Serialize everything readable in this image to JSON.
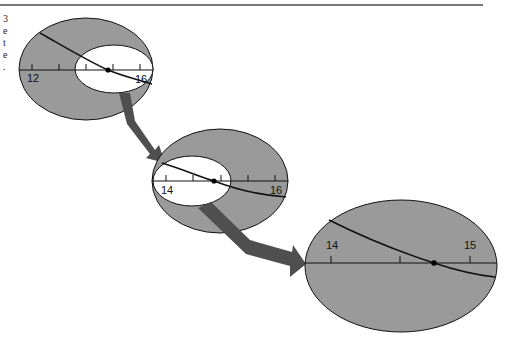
{
  "left_margin_text_fragments": [
    "3",
    "e",
    "t",
    "e",
    "."
  ],
  "colors": {
    "lens_fill": "#9a9a9a",
    "inner_fill": "#ffffff",
    "arrow_fill": "#4f4f4f",
    "stroke": "#111111",
    "rule": "#777777"
  },
  "panels": [
    {
      "name": "zoom-level-1",
      "axis_labels": [
        {
          "value": 12,
          "text": "12"
        },
        {
          "value": 16,
          "text": "16"
        }
      ],
      "tick_values": [
        12,
        13,
        14,
        15,
        16
      ],
      "highlighted_point": 15
    },
    {
      "name": "zoom-level-2",
      "axis_labels": [
        {
          "value": 14,
          "text": "14"
        },
        {
          "value": 16,
          "text": "16"
        }
      ],
      "tick_values": [
        14,
        14.5,
        15,
        15.5,
        16
      ],
      "highlighted_point": 14.8
    },
    {
      "name": "zoom-level-3",
      "axis_labels": [
        {
          "value": 14,
          "text": "14"
        },
        {
          "value": 15,
          "text": "15"
        }
      ],
      "tick_values": [
        14,
        14.33,
        14.67,
        15
      ],
      "highlighted_point": 14.85
    }
  ]
}
